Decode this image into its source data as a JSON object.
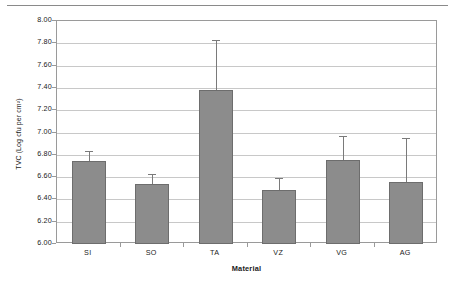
{
  "chart_data": {
    "type": "bar",
    "title": "",
    "subtitle": "",
    "xlabel": "Material",
    "ylabel": "TVC (Log cfu per cm²)",
    "categories": [
      "SI",
      "SO",
      "TA",
      "VZ",
      "VG",
      "AG"
    ],
    "values": [
      6.74,
      6.54,
      7.38,
      6.48,
      6.75,
      6.56
    ],
    "error_upper": [
      6.83,
      6.63,
      7.83,
      6.59,
      6.97,
      6.95
    ],
    "error_bar_type": "upper-only",
    "ylim": [
      6.0,
      8.0
    ],
    "ytick_step": 0.2,
    "ytick_labels": [
      "8.00",
      "7.80",
      "7.60",
      "7.40",
      "7.20",
      "7.00",
      "6.80",
      "6.60",
      "6.40",
      "6.20",
      "6.00"
    ],
    "ytick_values": [
      8.0,
      7.8,
      7.6,
      7.4,
      7.2,
      7.0,
      6.8,
      6.6,
      6.4,
      6.2,
      6.0
    ],
    "grid": true,
    "grid_axis": "y",
    "legend": false,
    "legend_position": "none",
    "series": [
      {
        "name": "TVC",
        "values": [
          6.74,
          6.54,
          7.38,
          6.48,
          6.75,
          6.56
        ]
      }
    ],
    "colors": {
      "bar_fill": "#8c8c8c",
      "bar_border": "#6d6d6d",
      "gridline": "#c8c8c8",
      "axis": "#9a9a9a",
      "error_bar": "#7a7a7a",
      "text": "#1a1a1a",
      "background": "#ffffff"
    }
  }
}
